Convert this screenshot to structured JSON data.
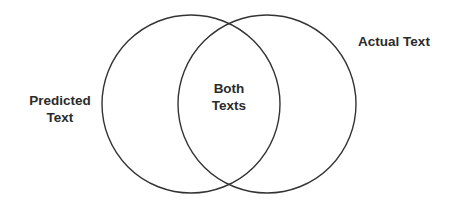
{
  "diagram": {
    "type": "venn",
    "stroke_color": "#333333",
    "text_color": "#2b2b2b",
    "background": "#ffffff",
    "sets": [
      {
        "id": "predicted",
        "label_line1": "Predicted",
        "label_line2": "Text",
        "circle": {
          "cx": 191,
          "cy": 104,
          "r": 89
        }
      },
      {
        "id": "actual",
        "label": "Actual Text",
        "circle": {
          "cx": 267,
          "cy": 104,
          "r": 89
        }
      }
    ],
    "intersection": {
      "label_line1": "Both",
      "label_line2": "Texts"
    }
  }
}
